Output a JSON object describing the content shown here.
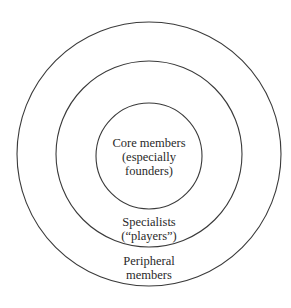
{
  "diagram": {
    "type": "concentric-circles",
    "center": [
      149,
      154
    ],
    "rings": [
      {
        "name": "core",
        "radius": 53,
        "lines": [
          "Core members",
          "(especially",
          "founders)"
        ]
      },
      {
        "name": "specialists",
        "radius": 93,
        "lines": [
          "Specialists",
          "(“players”)"
        ]
      },
      {
        "name": "peripheral",
        "radius": 132,
        "lines": [
          "Peripheral",
          "members"
        ]
      }
    ],
    "stroke_color": "#3a3a3a",
    "text_color": "#2a2a2a"
  }
}
